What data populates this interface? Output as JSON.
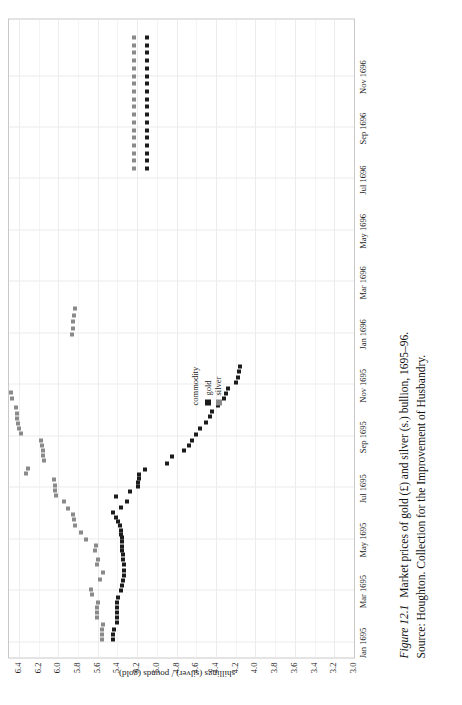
{
  "figure": {
    "number_label": "Figure 12.1",
    "caption": "Market prices of gold (£) and silver (s.) bullion, 1695–96.",
    "source": "Source: Houghton. Collection for the Improvement of Husbandry."
  },
  "legend": {
    "title": "commodity",
    "entries": [
      {
        "label": "gold",
        "color": "#1c1c1c"
      },
      {
        "label": "silver",
        "color": "#8a8a8a"
      }
    ]
  },
  "chart_data": {
    "type": "scatter",
    "title": "Market prices of gold (£) and silver (s.) bullion, 1695–96.",
    "xlabel": "",
    "ylabel": "shillings (silver) / pounds (gold)",
    "grid": true,
    "legend_position": "inside-center",
    "legend_title": "commodity",
    "xlim": [
      "1695-01-01",
      "1696-12-31"
    ],
    "ylim": [
      3.0,
      6.5
    ],
    "ytick_labels": [
      "6.4",
      "6.2",
      "6.0",
      "5.8",
      "5.6",
      "5.4",
      "5.2",
      "5.0",
      "4.8",
      "4.6",
      "4.4",
      "4.2",
      "4.0",
      "3.8",
      "3.6",
      "3.4",
      "3.2",
      "3.0"
    ],
    "ytick_values": [
      6.4,
      6.2,
      6.0,
      5.8,
      5.6,
      5.4,
      5.2,
      5.0,
      4.8,
      4.6,
      4.4,
      4.2,
      4.0,
      3.8,
      3.6,
      3.4,
      3.2,
      3.0
    ],
    "xtick_labels": [
      "Jan 1695",
      "Mar 1695",
      "May 1695",
      "Jul 1695",
      "Sep 1695",
      "Nov 1695",
      "Jan 1696",
      "Mar 1696",
      "May 1696",
      "Jul 1696",
      "Sep 1696",
      "Nov 1696"
    ],
    "xtick_months": [
      0,
      2,
      4,
      6,
      8,
      10,
      12,
      14,
      16,
      18,
      20,
      22
    ],
    "series": [
      {
        "name": "gold",
        "color": "#1c1c1c",
        "points": [
          [
            0.1,
            5.44
          ],
          [
            0.3,
            5.44
          ],
          [
            0.5,
            5.43
          ],
          [
            0.75,
            5.4
          ],
          [
            0.95,
            5.4
          ],
          [
            1.15,
            5.4
          ],
          [
            1.35,
            5.4
          ],
          [
            1.55,
            5.4
          ],
          [
            1.75,
            5.39
          ],
          [
            2.0,
            5.36
          ],
          [
            2.2,
            5.35
          ],
          [
            2.4,
            5.34
          ],
          [
            2.6,
            5.33
          ],
          [
            2.8,
            5.33
          ],
          [
            3.0,
            5.33
          ],
          [
            3.2,
            5.34
          ],
          [
            3.4,
            5.34
          ],
          [
            3.55,
            5.35
          ],
          [
            3.7,
            5.35
          ],
          [
            3.9,
            5.35
          ],
          [
            4.05,
            5.35
          ],
          [
            4.2,
            5.36
          ],
          [
            4.35,
            5.36
          ],
          [
            4.55,
            5.37
          ],
          [
            4.7,
            5.39
          ],
          [
            4.85,
            5.41
          ],
          [
            5.05,
            5.44
          ],
          [
            5.25,
            5.36
          ],
          [
            5.45,
            5.3
          ],
          [
            5.65,
            5.41
          ],
          [
            5.85,
            5.27
          ],
          [
            6.05,
            5.19
          ],
          [
            6.2,
            5.19
          ],
          [
            6.35,
            5.18
          ],
          [
            6.5,
            5.18
          ],
          [
            6.7,
            5.12
          ],
          [
            6.95,
            4.9
          ],
          [
            7.2,
            4.85
          ],
          [
            7.45,
            4.72
          ],
          [
            7.65,
            4.67
          ],
          [
            7.85,
            4.64
          ],
          [
            8.05,
            4.6
          ],
          [
            8.3,
            4.56
          ],
          [
            8.55,
            4.5
          ],
          [
            8.75,
            4.46
          ],
          [
            8.95,
            4.44
          ],
          [
            9.2,
            4.38
          ],
          [
            9.45,
            4.32
          ],
          [
            9.65,
            4.3
          ],
          [
            9.85,
            4.28
          ],
          [
            10.1,
            4.2
          ],
          [
            10.3,
            4.18
          ],
          [
            10.5,
            4.17
          ],
          [
            10.7,
            4.16
          ],
          [
            18.4,
            5.1
          ],
          [
            18.7,
            5.1
          ],
          [
            19.0,
            5.1
          ],
          [
            19.3,
            5.1
          ],
          [
            19.6,
            5.1
          ],
          [
            19.9,
            5.1
          ],
          [
            20.2,
            5.1
          ],
          [
            20.5,
            5.1
          ],
          [
            20.8,
            5.1
          ],
          [
            21.1,
            5.1
          ],
          [
            21.4,
            5.1
          ],
          [
            21.7,
            5.1
          ],
          [
            22.0,
            5.1
          ],
          [
            22.3,
            5.1
          ],
          [
            22.6,
            5.1
          ],
          [
            22.9,
            5.1
          ],
          [
            23.2,
            5.1
          ],
          [
            23.5,
            5.1
          ]
        ]
      },
      {
        "name": "silver",
        "color": "#8a8a8a",
        "points": [
          [
            0.1,
            5.56
          ],
          [
            0.3,
            5.56
          ],
          [
            0.5,
            5.56
          ],
          [
            0.7,
            5.55
          ],
          [
            0.95,
            5.61
          ],
          [
            1.15,
            5.61
          ],
          [
            1.35,
            5.61
          ],
          [
            1.55,
            5.6
          ],
          [
            1.85,
            5.66
          ],
          [
            2.05,
            5.67
          ],
          [
            2.45,
            5.58
          ],
          [
            2.7,
            5.55
          ],
          [
            3.0,
            5.61
          ],
          [
            3.2,
            5.6
          ],
          [
            3.55,
            5.63
          ],
          [
            3.75,
            5.62
          ],
          [
            4.0,
            5.72
          ],
          [
            4.25,
            5.77
          ],
          [
            4.55,
            5.83
          ],
          [
            4.75,
            5.84
          ],
          [
            4.95,
            5.85
          ],
          [
            5.2,
            5.9
          ],
          [
            5.45,
            5.94
          ],
          [
            5.7,
            6.02
          ],
          [
            5.9,
            6.03
          ],
          [
            6.1,
            6.03
          ],
          [
            6.3,
            6.04
          ],
          [
            6.55,
            6.33
          ],
          [
            6.75,
            6.31
          ],
          [
            7.05,
            6.15
          ],
          [
            7.25,
            6.16
          ],
          [
            7.45,
            6.16
          ],
          [
            7.65,
            6.17
          ],
          [
            7.85,
            6.18
          ],
          [
            8.1,
            6.38
          ],
          [
            8.3,
            6.4
          ],
          [
            8.5,
            6.41
          ],
          [
            8.7,
            6.42
          ],
          [
            8.9,
            6.42
          ],
          [
            9.1,
            6.43
          ],
          [
            9.45,
            6.47
          ],
          [
            9.7,
            6.48
          ],
          [
            11.95,
            5.86
          ],
          [
            12.2,
            5.85
          ],
          [
            12.45,
            5.85
          ],
          [
            12.7,
            5.84
          ],
          [
            12.95,
            5.83
          ],
          [
            18.4,
            5.23
          ],
          [
            18.7,
            5.23
          ],
          [
            19.0,
            5.23
          ],
          [
            19.3,
            5.23
          ],
          [
            19.6,
            5.23
          ],
          [
            19.9,
            5.23
          ],
          [
            20.2,
            5.23
          ],
          [
            20.5,
            5.23
          ],
          [
            20.8,
            5.23
          ],
          [
            21.1,
            5.23
          ],
          [
            21.4,
            5.23
          ],
          [
            21.7,
            5.23
          ],
          [
            22.0,
            5.23
          ],
          [
            22.3,
            5.23
          ],
          [
            22.6,
            5.23
          ],
          [
            22.9,
            5.23
          ],
          [
            23.2,
            5.23
          ],
          [
            23.5,
            5.23
          ]
        ]
      }
    ]
  }
}
